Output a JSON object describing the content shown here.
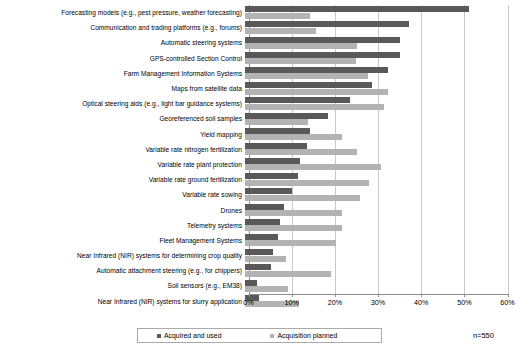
{
  "chart_data": {
    "type": "bar",
    "orientation": "horizontal",
    "title": "",
    "xlabel": "",
    "ylabel": "",
    "xlim": [
      0,
      60
    ],
    "xticks": [
      0,
      10,
      20,
      30,
      40,
      50,
      60
    ],
    "xtick_labels": [
      "0%",
      "10%",
      "20%",
      "30%",
      "40%",
      "50%",
      "60%"
    ],
    "grid": true,
    "legend_position": "bottom",
    "categories": [
      "Forecasting models (e.g., pest pressure, weather forecasting)",
      "Communication and trading platforms (e.g., forums)",
      "Automatic steering systems",
      "GPS-controlled Section Control",
      "Farm Management Information Systems",
      "Maps from satellite data",
      "Optical steering aids (e.g., light bar guidance systems)",
      "Georeferenced soil samples",
      "Yield mapping",
      "Variable rate nitrogen fertilization",
      "Variable rate plant protection",
      "Variable rate ground fertilization",
      "Variable rate sowing",
      "Drones",
      "Telemetry systems",
      "Fleet Management Systems",
      "Near Infrared (NIR) systems for determining crop quality",
      "Automatic attachment steering (e.g., for chippers)",
      "Soil sensors (e.g., EM38)",
      "Near Infrared (NIR) systems for slurry application"
    ],
    "series": [
      {
        "name": "Acquired and used",
        "color": "#595959",
        "values": [
          52.0,
          38.0,
          35.8,
          36.0,
          33.2,
          29.5,
          24.4,
          19.3,
          15.1,
          14.4,
          12.8,
          12.2,
          11.0,
          9.0,
          8.2,
          7.7,
          6.6,
          6.0,
          2.8,
          3.3
        ]
      },
      {
        "name": "Acquisition planned",
        "color": "#b3b3b3",
        "values": [
          15.0,
          16.5,
          26.0,
          25.6,
          28.6,
          33.2,
          32.3,
          14.7,
          22.5,
          26.0,
          31.4,
          28.7,
          26.7,
          22.5,
          22.5,
          21.0,
          9.5,
          20.0,
          10.0,
          12.5
        ]
      }
    ],
    "annotations": {
      "sample_size": "n=550"
    }
  },
  "legend": {
    "items": [
      {
        "label": "Acquired and used"
      },
      {
        "label": "Acquisition planned"
      }
    ]
  }
}
